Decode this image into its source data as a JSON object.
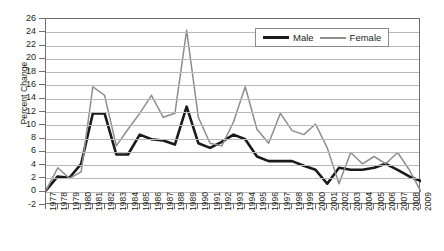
{
  "chart_data": {
    "type": "line",
    "title": "",
    "xlabel": "",
    "ylabel": "Percent Change",
    "ylim": [
      -2,
      26
    ],
    "ytick_step": 2,
    "grid": true,
    "legend_position": "top-right",
    "x": [
      1977,
      1978,
      1979,
      1980,
      1981,
      1982,
      1983,
      1984,
      1985,
      1986,
      1987,
      1988,
      1989,
      1990,
      1991,
      1992,
      1993,
      1994,
      1995,
      1996,
      1997,
      1998,
      1999,
      2000,
      2001,
      2002,
      2003,
      2004,
      2005,
      2006,
      2007,
      2008,
      2009
    ],
    "xtick_labels": [
      "1977",
      "1978",
      "1979",
      "1980",
      "1981",
      "1982",
      "1983",
      "1984",
      "1985",
      "1986",
      "1987",
      "1988",
      "1989",
      "1990",
      "1991",
      "1992",
      "1993",
      "1994",
      "1995",
      "1996",
      "1997",
      "1998",
      "1999",
      "2000",
      "2001",
      "2002",
      "2003",
      "2004",
      "2005",
      "2006",
      "2007",
      "2008",
      "2009"
    ],
    "ytick_labels": [
      "26",
      "24",
      "22",
      "20",
      "18",
      "16",
      "14",
      "12",
      "10",
      "8",
      "6",
      "4",
      "2",
      "0",
      "-2"
    ],
    "series": [
      {
        "name": "Male",
        "color": "#1a1a1a",
        "width": 2.6,
        "values": [
          0.2,
          2.3,
          2.1,
          4.2,
          11.8,
          11.8,
          5.6,
          5.6,
          8.6,
          7.9,
          7.7,
          7.1,
          12.8,
          7.3,
          6.6,
          7.5,
          8.6,
          7.9,
          5.3,
          4.6,
          4.6,
          4.6,
          3.9,
          3.3,
          1.2,
          3.6,
          3.3,
          3.3,
          3.6,
          4.2,
          3.3,
          2.3,
          1.6
        ]
      },
      {
        "name": "Female",
        "color": "#8d8d8d",
        "width": 1.5,
        "values": [
          0.2,
          3.6,
          2.0,
          3.0,
          15.8,
          14.5,
          6.9,
          9.4,
          11.8,
          14.5,
          11.2,
          11.8,
          24.3,
          11.2,
          7.3,
          6.9,
          10.5,
          15.8,
          9.4,
          7.3,
          11.8,
          9.2,
          8.6,
          10.2,
          6.6,
          1.2,
          5.9,
          4.2,
          5.3,
          4.2,
          5.9,
          3.3,
          0.0
        ]
      }
    ]
  },
  "legend": {
    "entries": [
      {
        "label": "Male"
      },
      {
        "label": "Female"
      }
    ]
  }
}
